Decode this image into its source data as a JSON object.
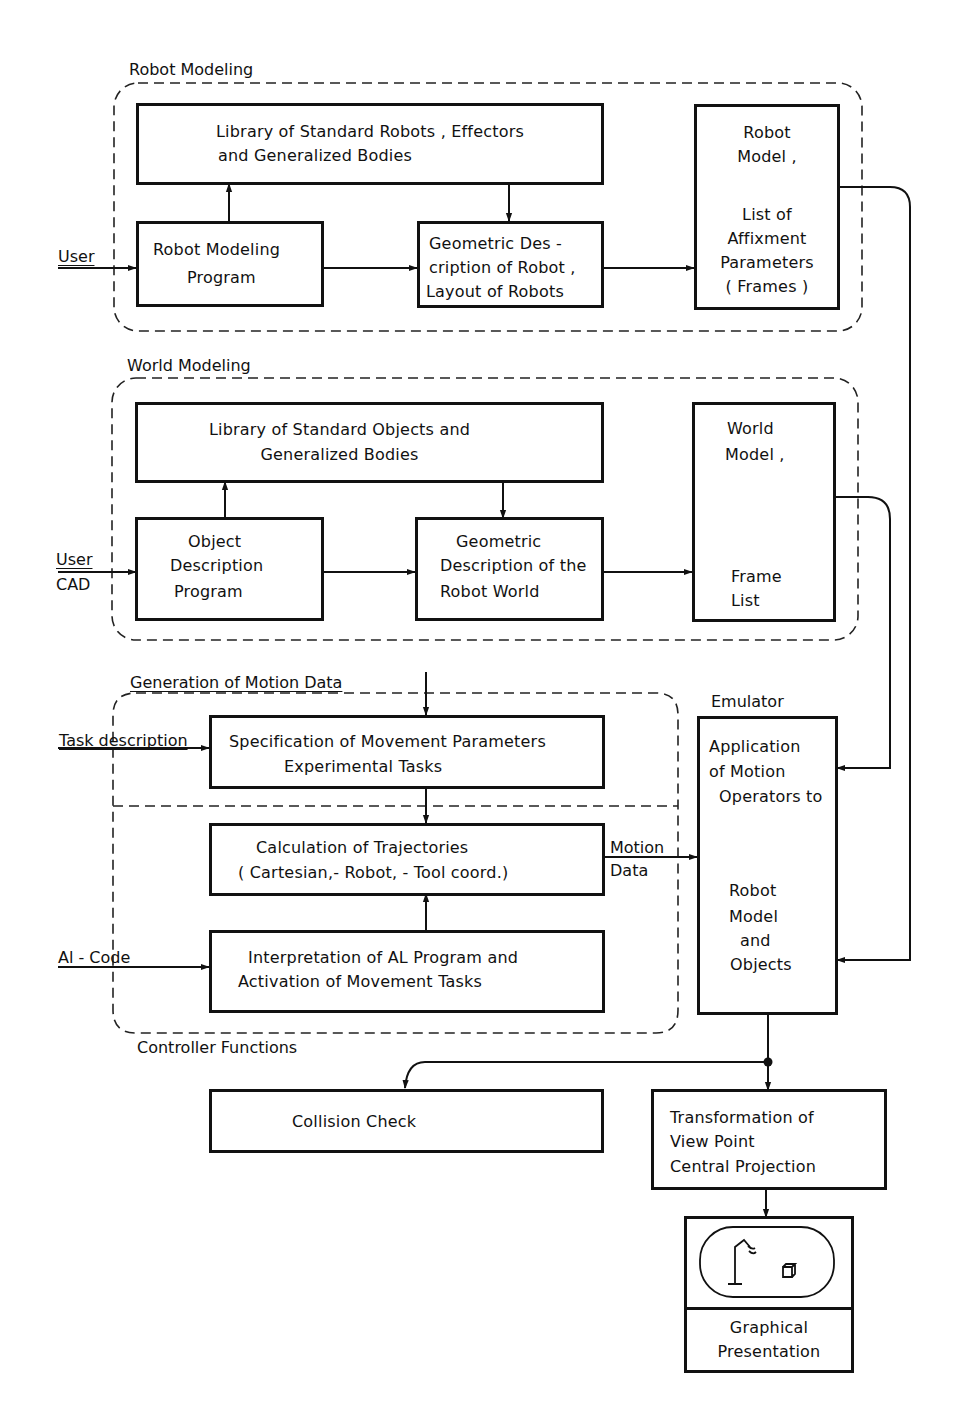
{
  "groups": {
    "robot_modeling": "Robot Modeling",
    "world_modeling": "World Modeling",
    "motion_generation": "Generation of Motion Data",
    "controller_functions": "Controller Functions",
    "emulator": "Emulator"
  },
  "inputs": {
    "user1": "User",
    "user2": "User",
    "cad": "CAD",
    "task_description": "Task description",
    "al_code": "Al - Code",
    "motion_data_line1": "Motion",
    "motion_data_line2": "Data"
  },
  "robot_modeling": {
    "library": [
      "Library of Standard Robots , Effectors",
      "and Generalized Bodies"
    ],
    "program": [
      "Robot Modeling",
      "Program"
    ],
    "geometric": [
      "Geometric Des -",
      "cription of Robot ,",
      "Layout of Robots"
    ],
    "model": [
      "Robot",
      "Model ,",
      "",
      "List of",
      "Affixment",
      "Parameters",
      "( Frames )"
    ]
  },
  "world_modeling": {
    "library": [
      "Library of Standard Objects and",
      "Generalized Bodies"
    ],
    "program": [
      "Object",
      "Description",
      "Program"
    ],
    "geometric": [
      "Geometric",
      "Description of the",
      "Robot World"
    ],
    "model_top": [
      "World",
      "Model ,"
    ],
    "model_bottom": [
      "Frame",
      "List"
    ]
  },
  "motion": {
    "specification": [
      "Specification of Movement Parameters",
      "Experimental Tasks"
    ],
    "trajectories": [
      "Calculation of Trajectories",
      "( Cartesian,- Robot, - Tool coord.)"
    ],
    "interpretation": [
      "Interpretation of AL Program and",
      "Activation of Movement Tasks"
    ]
  },
  "emulator": {
    "top": [
      "Application",
      "of Motion",
      "Operators to"
    ],
    "bottom": [
      "Robot",
      "Model",
      "and",
      "Objects"
    ]
  },
  "output": {
    "collision": "Collision Check",
    "transformation": [
      "Transformation of",
      "View Point",
      "Central Projection"
    ],
    "graphical": [
      "Graphical",
      "Presentation"
    ]
  }
}
